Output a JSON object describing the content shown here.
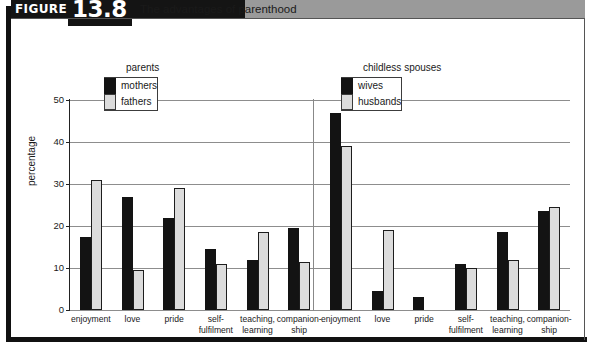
{
  "figure": {
    "label": "FIGURE",
    "number": "13.8",
    "caption": "The advantages of parenthood"
  },
  "legends": [
    {
      "title": "parents",
      "entries": [
        {
          "label": "mothers",
          "swatch": "dark",
          "color": "#131313"
        },
        {
          "label": "fathers",
          "swatch": "light",
          "color": "#dcdcdc"
        }
      ]
    },
    {
      "title": "childless spouses",
      "entries": [
        {
          "label": "wives",
          "swatch": "dark",
          "color": "#131313"
        },
        {
          "label": "husbands",
          "swatch": "light",
          "color": "#dcdcdc"
        }
      ]
    }
  ],
  "chart_data": {
    "type": "bar",
    "title": "The advantages of parenthood",
    "xlabel": "",
    "ylabel": "percentage",
    "ylim": [
      0,
      50
    ],
    "yticks": [
      0,
      10,
      20,
      30,
      40,
      50
    ],
    "grid": true,
    "legend_position": "top-inside",
    "panels": [
      {
        "name": "parents",
        "categories": [
          "enjoyment",
          "love",
          "pride",
          "self-\nfulfilment",
          "teaching,\nlearning",
          "companion-\nship"
        ],
        "series": [
          {
            "name": "mothers",
            "color": "#131313",
            "values": [
              17.5,
              27,
              22,
              14.5,
              12,
              19.5
            ]
          },
          {
            "name": "fathers",
            "color": "#dcdcdc",
            "values": [
              31,
              9.5,
              29,
              11,
              18.5,
              11.5
            ]
          }
        ]
      },
      {
        "name": "childless spouses",
        "categories": [
          "enjoyment",
          "love",
          "pride",
          "self-\nfulfilment",
          "teaching,\nlearning",
          "companion-\nship"
        ],
        "series": [
          {
            "name": "wives",
            "color": "#131313",
            "values": [
              47,
              4.5,
              3,
              11,
              18.5,
              23.5
            ]
          },
          {
            "name": "husbands",
            "color": "#dcdcdc",
            "values": [
              39,
              19,
              0,
              10,
              12,
              24.5
            ]
          }
        ]
      }
    ]
  }
}
